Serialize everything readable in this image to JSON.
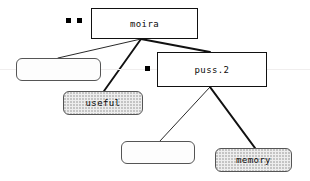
{
  "diagram": {
    "background_color": "#ffffff",
    "ink_color": "#111111",
    "fill_color": "#eeeeee",
    "nodes": [
      {
        "id": "moira",
        "label": "moira",
        "shape": "rectangle",
        "style": "sharp",
        "x": 91,
        "y": 8,
        "w": 107,
        "h": 31
      },
      {
        "id": "left-empty",
        "label": "",
        "shape": "rounded-rectangle",
        "style": "round-plain",
        "x": 16,
        "y": 58,
        "w": 85,
        "h": 23
      },
      {
        "id": "useful",
        "label": "useful",
        "shape": "rounded-rectangle",
        "style": "round-fill",
        "x": 63,
        "y": 91,
        "w": 80,
        "h": 24
      },
      {
        "id": "puss2",
        "label": "puss.2",
        "shape": "rectangle",
        "style": "sharp",
        "x": 157,
        "y": 52,
        "w": 110,
        "h": 35
      },
      {
        "id": "bottom-empty",
        "label": "",
        "shape": "rounded-rectangle",
        "style": "round-plain",
        "x": 121,
        "y": 141,
        "w": 74,
        "h": 23
      },
      {
        "id": "memory",
        "label": "memory",
        "shape": "rounded-rectangle",
        "style": "round-fill",
        "x": 215,
        "y": 148,
        "w": 77,
        "h": 24
      }
    ],
    "edges": [
      {
        "id": "moira-to-left-empty",
        "from": "moira",
        "to": "left-empty",
        "x1": 141,
        "y1": 39,
        "x2": 58,
        "y2": 58,
        "width": 0.9
      },
      {
        "id": "moira-to-useful",
        "from": "moira",
        "to": "useful",
        "x1": 141,
        "y1": 39,
        "x2": 104,
        "y2": 91,
        "width": 1.9
      },
      {
        "id": "moira-to-puss2",
        "from": "moira",
        "to": "puss.2",
        "x1": 141,
        "y1": 39,
        "x2": 210,
        "y2": 52,
        "width": 1.9
      },
      {
        "id": "puss2-to-bottom-empty",
        "from": "puss.2",
        "to": "bottom-empty",
        "x1": 210,
        "y1": 87,
        "x2": 160,
        "y2": 141,
        "width": 0.9
      },
      {
        "id": "puss2-to-memory",
        "from": "puss.2",
        "to": "memory",
        "x1": 210,
        "y1": 87,
        "x2": 255,
        "y2": 148,
        "width": 2.1
      }
    ],
    "markers": [
      {
        "id": "marker-1",
        "x": 66,
        "y": 18,
        "size": 5
      },
      {
        "id": "marker-2",
        "x": 77,
        "y": 18,
        "size": 5
      },
      {
        "id": "marker-3",
        "x": 145,
        "y": 66,
        "size": 5
      }
    ],
    "guide_line": {
      "y": 69,
      "color": "#f0eeee"
    }
  }
}
